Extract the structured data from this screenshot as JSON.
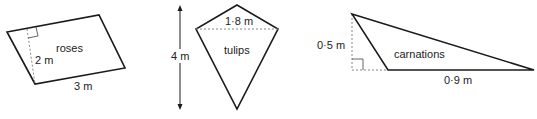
{
  "figures": [
    {
      "name": "roses",
      "shape": "parallelogram",
      "label": "roses",
      "height_label": "2 m",
      "base_label": "3 m"
    },
    {
      "name": "tulips",
      "shape": "kite",
      "label": "tulips",
      "width_label": "1·8 m",
      "height_label": "4 m"
    },
    {
      "name": "carnations",
      "shape": "obtuse triangle",
      "label": "carnations",
      "height_label": "0·5 m",
      "base_label": "0·9 m"
    }
  ],
  "colors": {
    "stroke": "#1a1a1a",
    "dashed": "#888888",
    "text": "#222222"
  }
}
